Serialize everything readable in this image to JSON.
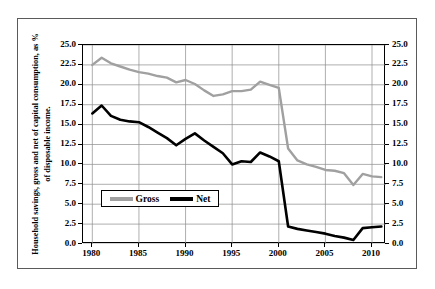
{
  "figure": {
    "ylabel": "Household savings, gross and net of capital consumption, as % of disposable income."
  },
  "colors": {
    "gross": "#a0a0a0",
    "net": "#000000",
    "grid": "#8c8c8c",
    "axis": "#000000",
    "frame": "#5a5a5a",
    "background": "#ffffff"
  },
  "legend": {
    "position": "inside-bottom-left",
    "items": [
      {
        "label": "Gross",
        "color": "#a0a0a0",
        "swatch": "line-swatch-gross"
      },
      {
        "label": "Net",
        "color": "#000000",
        "swatch": "line-swatch-net"
      }
    ]
  },
  "axes": {
    "y_left_ticks": [
      "25.0",
      "22.5",
      "20.0",
      "17.5",
      "15.0",
      "12.5",
      "10.0",
      "7.5",
      "5.0",
      "2.5",
      "0.0"
    ],
    "y_right_ticks": [
      "25.0",
      "22.5",
      "20.0",
      "17.5",
      "15.0",
      "12.5",
      "10.0",
      "7.5",
      "5.0",
      "2.5",
      "0.0"
    ],
    "x_ticks": [
      "1980",
      "1985",
      "1990",
      "1995",
      "2000",
      "2005",
      "2010"
    ]
  },
  "chart_data": {
    "type": "line",
    "title": "",
    "subtitle": "",
    "xlabel": "",
    "ylabel": "Household savings, gross and net of capital consumption, as % of disposable income.",
    "xlim": [
      1979,
      2011.5
    ],
    "ylim": [
      0.0,
      25.0
    ],
    "ytick_step": 2.5,
    "xtick_step": 5,
    "grid": true,
    "grid_axis": "both",
    "legend_position": "inside-bottom-left",
    "x": [
      1980,
      1981,
      1982,
      1983,
      1984,
      1985,
      1986,
      1987,
      1988,
      1989,
      1990,
      1991,
      1992,
      1993,
      1994,
      1995,
      1996,
      1997,
      1998,
      1999,
      2000,
      2001,
      2002,
      2003,
      2004,
      2005,
      2006,
      2007,
      2008,
      2009,
      2010,
      2011
    ],
    "series": [
      {
        "name": "Gross",
        "color": "#a0a0a0",
        "values": [
          22.5,
          23.4,
          22.7,
          22.3,
          21.9,
          21.6,
          21.4,
          21.1,
          20.9,
          20.3,
          20.6,
          20.1,
          19.3,
          18.6,
          18.8,
          19.2,
          19.2,
          19.4,
          20.4,
          20.0,
          19.6,
          12.0,
          10.5,
          10.0,
          9.7,
          9.3,
          9.2,
          8.9,
          7.4,
          8.8,
          8.5,
          8.4
        ]
      },
      {
        "name": "Net",
        "color": "#000000",
        "values": [
          16.4,
          17.4,
          16.1,
          15.6,
          15.4,
          15.3,
          14.7,
          14.0,
          13.3,
          12.4,
          13.2,
          13.9,
          13.0,
          12.2,
          11.4,
          10.0,
          10.4,
          10.3,
          11.5,
          11.0,
          10.4,
          2.2,
          1.9,
          1.7,
          1.5,
          1.3,
          1.0,
          0.8,
          0.5,
          2.0,
          2.1,
          2.2
        ]
      }
    ]
  }
}
